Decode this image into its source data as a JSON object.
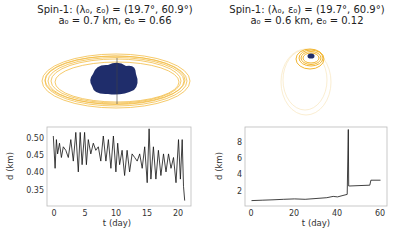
{
  "panels": [
    {
      "title_line1": "Spin-1: (λ₀, ε₀) = (19.7°, 60.9°)",
      "title_line2": "a₀ = 0.7 km, e₀ = 0.66"
    },
    {
      "title_line1": "Spin-1: (λ₀, ε₀) = (19.7°, 60.9°)",
      "title_line2": "a₀ = 0.6 km, e₀ = 0.12"
    }
  ],
  "colors": {
    "orbit": "#f2b632",
    "body": "#1f2d6b",
    "line": "#111111",
    "axes": "#bbbbbb"
  },
  "chart_data": [
    {
      "type": "line",
      "title": "Spin-1: (λ0, ε0) = (19.7°, 60.9°); a0 = 0.7 km, e0 = 0.66",
      "xlabel": "t (day)",
      "ylabel": "d (km)",
      "xlim": [
        -1,
        22
      ],
      "ylim": [
        0.305,
        0.525
      ],
      "xticks": [
        0,
        5,
        10,
        15,
        20
      ],
      "yticks": [
        0.35,
        0.4,
        0.45,
        0.5
      ],
      "ytick_labels": [
        "0.35",
        "0.40",
        "0.45",
        "0.50"
      ],
      "x": [
        0,
        0.3,
        0.5,
        0.7,
        1,
        1.3,
        1.6,
        2,
        2.4,
        2.8,
        3.2,
        3.6,
        4,
        4.3,
        4.6,
        5,
        5.3,
        5.6,
        6,
        6.4,
        6.8,
        7.2,
        7.6,
        8,
        8.4,
        8.8,
        9.2,
        9.6,
        10,
        10.3,
        10.6,
        11,
        11.4,
        11.8,
        12.2,
        12.6,
        13,
        13.4,
        13.8,
        14.2,
        14.6,
        15,
        15.3,
        15.6,
        16,
        16.4,
        16.8,
        17.2,
        17.6,
        18,
        18.4,
        18.8,
        19.2,
        19.6,
        20,
        20.3,
        20.6,
        20.8,
        21
      ],
      "y": [
        0.5,
        0.41,
        0.49,
        0.45,
        0.48,
        0.44,
        0.47,
        0.46,
        0.44,
        0.49,
        0.43,
        0.51,
        0.4,
        0.51,
        0.42,
        0.51,
        0.42,
        0.49,
        0.45,
        0.48,
        0.46,
        0.47,
        0.43,
        0.5,
        0.43,
        0.49,
        0.41,
        0.5,
        0.4,
        0.48,
        0.42,
        0.46,
        0.39,
        0.46,
        0.4,
        0.45,
        0.44,
        0.43,
        0.45,
        0.41,
        0.47,
        0.37,
        0.52,
        0.38,
        0.47,
        0.38,
        0.46,
        0.39,
        0.45,
        0.4,
        0.45,
        0.41,
        0.44,
        0.37,
        0.49,
        0.38,
        0.49,
        0.36,
        0.32
      ],
      "grid": false
    },
    {
      "type": "line",
      "title": "Spin-1: (λ0, ε0) = (19.7°, 60.9°); a0 = 0.6 km, e0 = 0.12",
      "xlabel": "t (day)",
      "ylabel": "d (km)",
      "xlim": [
        -3,
        63
      ],
      "ylim": [
        0,
        9.5
      ],
      "xticks": [
        0,
        20,
        40,
        60
      ],
      "yticks": [
        2,
        4,
        6,
        8
      ],
      "x": [
        0,
        5,
        10,
        15,
        20,
        25,
        30,
        35,
        38,
        40,
        43,
        44.5,
        45,
        45.2,
        45.5,
        50,
        55,
        55.5,
        60
      ],
      "y": [
        0.65,
        0.7,
        0.75,
        0.8,
        0.85,
        0.8,
        0.9,
        1.0,
        1.15,
        1.1,
        1.3,
        1.4,
        9.2,
        2.4,
        2.4,
        2.45,
        2.5,
        3.1,
        3.1
      ],
      "grid": false
    }
  ]
}
